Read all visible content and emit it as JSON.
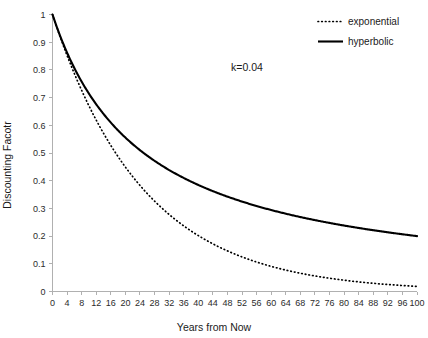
{
  "chart_data": {
    "type": "line",
    "title": "",
    "xlabel": "Years from Now",
    "ylabel": "Discounting Facotr",
    "xlim": [
      0,
      100
    ],
    "ylim": [
      0,
      1
    ],
    "grid": false,
    "legend_position": "top-right",
    "annotations": [
      {
        "text": "k=0.04",
        "x": 48,
        "y": 0.83
      }
    ],
    "xticks": [
      0,
      4,
      8,
      12,
      16,
      20,
      24,
      28,
      32,
      36,
      40,
      44,
      48,
      52,
      56,
      60,
      64,
      68,
      72,
      76,
      80,
      84,
      88,
      92,
      96,
      100
    ],
    "yticks": [
      0,
      0.1,
      0.2,
      0.3,
      0.4,
      0.5,
      0.6,
      0.7,
      0.8,
      0.9,
      1
    ],
    "ytick_labels": [
      "0",
      "0.1",
      "0.2",
      "0.3",
      "0.4",
      "0.5",
      "0.6",
      "0.7",
      "0.8",
      "0.9",
      "1"
    ],
    "k": 0.04,
    "x": [
      0,
      4,
      8,
      12,
      16,
      20,
      24,
      28,
      32,
      36,
      40,
      44,
      48,
      52,
      56,
      60,
      64,
      68,
      72,
      76,
      80,
      84,
      88,
      92,
      96,
      100
    ],
    "series": [
      {
        "name": "exponential",
        "style": "dotted",
        "color": "#000000",
        "formula": "exp(-k*t)",
        "values": [
          1,
          0.852,
          0.726,
          0.619,
          0.527,
          0.449,
          0.383,
          0.326,
          0.278,
          0.237,
          0.202,
          0.172,
          0.147,
          0.125,
          0.106,
          0.091,
          0.077,
          0.066,
          0.056,
          0.048,
          0.041,
          0.035,
          0.03,
          0.025,
          0.021,
          0.018
        ]
      },
      {
        "name": "hyperbolic",
        "style": "solid",
        "color": "#000000",
        "formula": "1/(1+k*t)",
        "values": [
          1,
          0.862,
          0.758,
          0.676,
          0.61,
          0.556,
          0.51,
          0.472,
          0.439,
          0.41,
          0.385,
          0.362,
          0.342,
          0.325,
          0.309,
          0.294,
          0.281,
          0.269,
          0.258,
          0.248,
          0.238,
          0.23,
          0.221,
          0.214,
          0.207,
          0.2
        ]
      }
    ],
    "legend": [
      {
        "label": "exponential",
        "style": "dotted"
      },
      {
        "label": "hyperbolic",
        "style": "solid"
      }
    ]
  }
}
